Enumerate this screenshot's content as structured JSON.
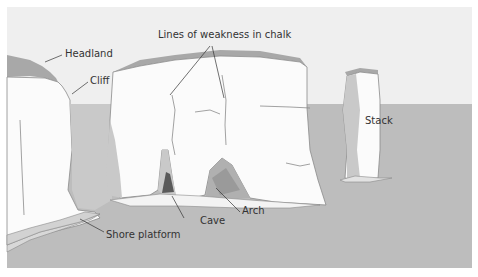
{
  "diagram": {
    "type": "coastal-erosion-landforms",
    "colors": {
      "sky": "#efefef",
      "sea": "#bdbdbd",
      "chalk_face": "#fbfbfb",
      "chalk_shadow": "#c9c9c9",
      "turf": "#a8a8a8",
      "cave": "#5a5a5a",
      "outline": "#8a8a8a",
      "leader": "#333333"
    },
    "labels": {
      "headland": "Headland",
      "cliff": "Cliff",
      "lines_of_weakness": "Lines of weakness in chalk",
      "stack": "Stack",
      "cave": "Cave",
      "arch": "Arch",
      "shore_platform": "Shore platform"
    }
  }
}
